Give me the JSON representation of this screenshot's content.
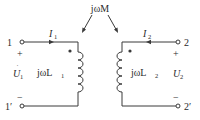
{
  "diagram": {
    "type": "coupled-inductors-circuit",
    "mutual_label": "jωM",
    "left": {
      "terminal_top": "1",
      "terminal_bottom": "1′",
      "plus": "+",
      "minus": "−",
      "voltage": "U",
      "voltage_sub": "1",
      "current": "I",
      "current_sub": "1",
      "inductor_label": "jωL",
      "inductor_sub": "1"
    },
    "right": {
      "terminal_top": "2",
      "terminal_bottom": "2′",
      "plus": "+",
      "minus": "−",
      "voltage": "U",
      "voltage_sub": "2",
      "current": "I",
      "current_sub": "2",
      "inductor_label": "jωL",
      "inductor_sub": "2"
    },
    "colors": {
      "line": "#3a3a3a",
      "background": "#ffffff"
    }
  }
}
